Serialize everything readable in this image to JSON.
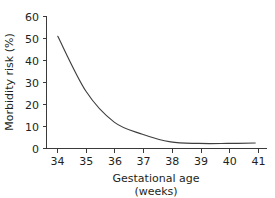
{
  "chart_data": {
    "type": "line",
    "title": "",
    "subtitle": "",
    "xlabel": "Gestational age",
    "xlabel_line2": "(weeks)",
    "ylabel": "Morbidity risk (%)",
    "x": [
      34,
      35,
      36,
      37,
      38,
      39,
      40,
      41
    ],
    "categories": [
      "34",
      "35",
      "36",
      "37",
      "38",
      "39",
      "40",
      "41"
    ],
    "values": [
      51,
      26,
      12,
      6.5,
      3,
      2.3,
      2.3,
      2.5
    ],
    "series": [
      {
        "name": "Morbidity risk",
        "values": [
          51,
          26,
          12,
          6.5,
          3,
          2.3,
          2.3,
          2.5
        ]
      }
    ],
    "xlim": [
      33.6,
      41.4
    ],
    "ylim": [
      0,
      60
    ],
    "xticks": [
      34,
      35,
      36,
      37,
      38,
      39,
      40,
      41
    ],
    "yticks": [
      0,
      10,
      20,
      30,
      40,
      50,
      60
    ],
    "xtick_labels": [
      "34",
      "35",
      "36",
      "37",
      "38",
      "39",
      "40",
      "41"
    ],
    "ytick_labels": [
      "0",
      "10",
      "20",
      "30",
      "40",
      "50",
      "60"
    ],
    "grid": false,
    "legend": false,
    "legend_position": "none",
    "line_color": "#3f3f3f",
    "axis_color": "#3a3a3a",
    "text_color": "#231f20",
    "background_color": "#ffffff"
  },
  "axes": {
    "y_title": "Morbidity risk (%)",
    "x_title_line1": "Gestational age",
    "x_title_line2": "(weeks)"
  },
  "ticks": {
    "y": [
      "60",
      "50",
      "40",
      "30",
      "20",
      "10",
      "0"
    ],
    "x": [
      "34",
      "35",
      "36",
      "37",
      "38",
      "39",
      "40",
      "41"
    ]
  }
}
